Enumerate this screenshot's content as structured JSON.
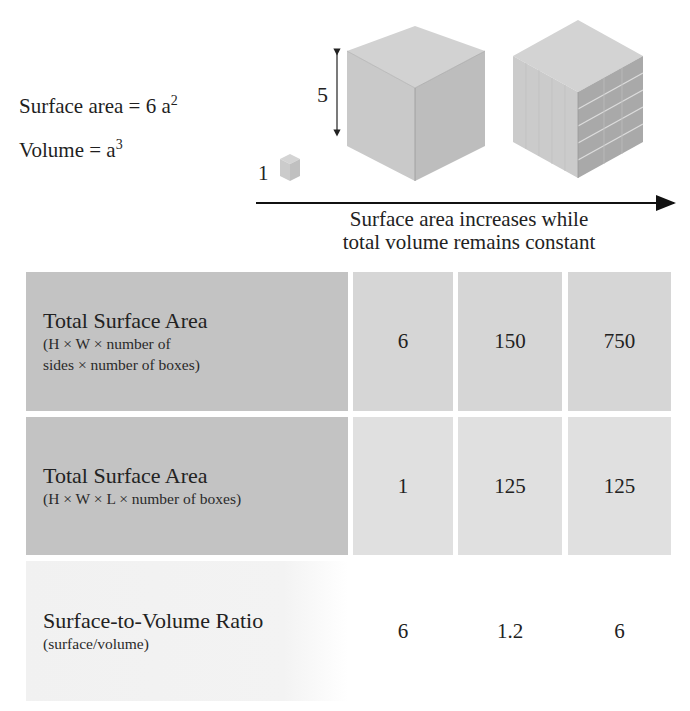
{
  "formulas": {
    "surface_area": {
      "text": "Surface area = 6 a",
      "exponent": "2"
    },
    "volume": {
      "text": "Volume = a",
      "exponent": "3"
    }
  },
  "diagram": {
    "small_cube_label": "1",
    "large_cube_dimension_label": "5",
    "caption_line1": "Surface area increases while",
    "caption_line2": "total volume remains constant",
    "colors": {
      "cube_top": "#d2d2d2",
      "cube_left": "#c9c9c9",
      "cube_right": "#bcbcbc",
      "subdivided_right": "#a9a9a9",
      "arrow": "#111111"
    }
  },
  "table": {
    "rows": [
      {
        "title": "Total Surface Area",
        "subtitle_lines": [
          "(H × W × number of",
          "sides × number of boxes)"
        ],
        "values": [
          "6",
          "150",
          "750"
        ]
      },
      {
        "title": "Total Surface Area",
        "subtitle_lines": [
          "(H × W × L × number of boxes)"
        ],
        "values": [
          "1",
          "125",
          "125"
        ]
      },
      {
        "title": "Surface-to-Volume Ratio",
        "subtitle_lines": [
          "(surface/volume)"
        ],
        "values": [
          "6",
          "1.2",
          "6"
        ]
      }
    ]
  }
}
